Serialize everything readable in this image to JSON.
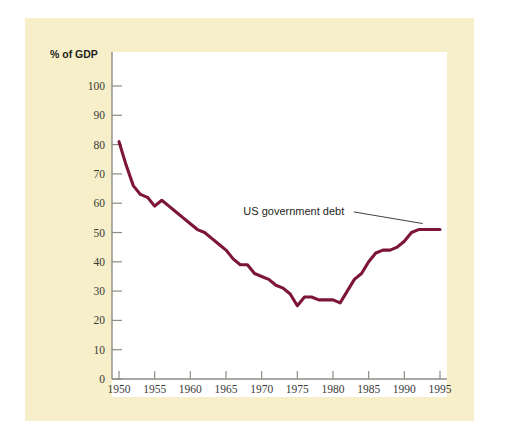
{
  "chart_data": {
    "type": "line",
    "title": "",
    "subtitle": "",
    "xlabel": "",
    "ylabel": "% of GDP",
    "ylabel_position": "top-left",
    "xlim": [
      1950,
      1996
    ],
    "ylim": [
      0,
      105
    ],
    "grid": false,
    "legend": null,
    "legend_position": "none",
    "y_ticks": [
      0,
      10,
      20,
      30,
      40,
      50,
      60,
      70,
      80,
      90,
      100
    ],
    "y_tick_labels": [
      "0",
      "10",
      "20",
      "30",
      "40",
      "50",
      "60",
      "70",
      "80",
      "90",
      "100"
    ],
    "x_ticks": [
      1950,
      1955,
      1960,
      1965,
      1970,
      1975,
      1980,
      1985,
      1990,
      1995
    ],
    "x_tick_labels": [
      "1950",
      "1955",
      "1960",
      "1965",
      "1970",
      "1975",
      "1980",
      "1985",
      "1990",
      "1995"
    ],
    "series": [
      {
        "name": "US government debt",
        "color": "#7d1536",
        "x": [
          1950,
          1951,
          1952,
          1953,
          1954,
          1955,
          1956,
          1957,
          1958,
          1959,
          1960,
          1961,
          1962,
          1963,
          1964,
          1965,
          1966,
          1967,
          1968,
          1969,
          1970,
          1971,
          1972,
          1973,
          1974,
          1975,
          1976,
          1977,
          1978,
          1979,
          1980,
          1981,
          1982,
          1983,
          1984,
          1985,
          1986,
          1987,
          1988,
          1989,
          1990,
          1991,
          1992,
          1993,
          1994,
          1995
        ],
        "values": [
          81,
          73,
          66,
          63,
          62,
          59,
          61,
          59,
          57,
          55,
          53,
          51,
          50,
          48,
          46,
          44,
          41,
          39,
          39,
          36,
          35,
          34,
          32,
          31,
          29,
          25,
          28,
          28,
          27,
          27,
          27,
          26,
          30,
          34,
          36,
          40,
          43,
          44,
          44,
          45,
          47,
          50,
          51,
          51,
          51,
          51
        ],
        "units": "% of GDP"
      }
    ],
    "annotations": [
      {
        "text": "US government debt",
        "anchor_x": 1993,
        "anchor_y": 51,
        "label_x": 1974.5,
        "label_y": 56
      }
    ]
  },
  "figure": {
    "background_color": "#ffffff",
    "panel_color": "#f6efc9",
    "plot_color": "#ffffff",
    "axis_color": "#8d8d84",
    "text_color": "#1f1f1c"
  }
}
